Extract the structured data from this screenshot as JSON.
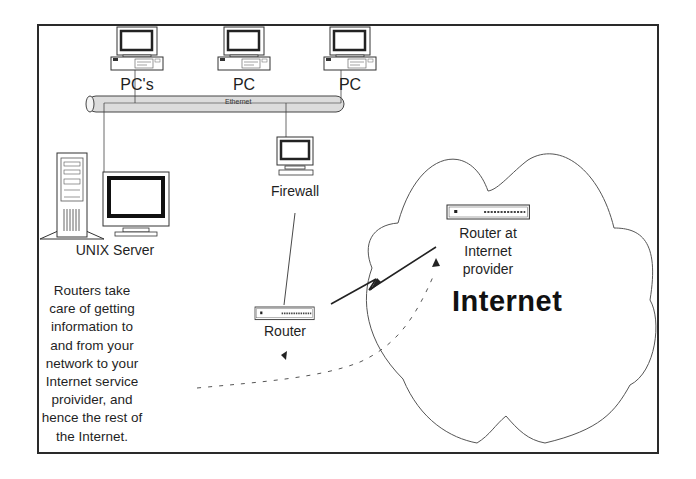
{
  "diagram": {
    "type": "network-topology",
    "nodes": {
      "pc1": {
        "label": "PC's"
      },
      "pc2": {
        "label": "PC"
      },
      "pc3": {
        "label": "PC"
      },
      "unix_server": {
        "label": "UNIX Server"
      },
      "firewall": {
        "label": "Firewall"
      },
      "router": {
        "label": "Router"
      },
      "isp_router": {
        "label_lines": [
          "Router at",
          "Internet",
          "provider"
        ]
      },
      "internet_cloud": {
        "label": "Internet"
      }
    },
    "bus": {
      "label": "Ethernet"
    },
    "description_lines": [
      "Routers  take",
      "care of getting",
      "information to",
      "and from your",
      "network to your",
      "Internet service",
      "proivider, and",
      "hence the rest of",
      "the Internet."
    ],
    "edges": [
      {
        "from": "pc1",
        "to": "ethernet"
      },
      {
        "from": "pc2",
        "to": "ethernet"
      },
      {
        "from": "pc3",
        "to": "ethernet"
      },
      {
        "from": "unix_server",
        "to": "ethernet"
      },
      {
        "from": "ethernet",
        "to": "firewall"
      },
      {
        "from": "firewall",
        "to": "router"
      },
      {
        "from": "router",
        "to": "isp_router",
        "style": "lightning-link"
      },
      {
        "from": "description",
        "to": "isp_router",
        "style": "dashed-arrow"
      }
    ],
    "colors": {
      "line": "#2a2a2a",
      "bus_fill": "#d9d9d9",
      "background": "#ffffff"
    }
  }
}
